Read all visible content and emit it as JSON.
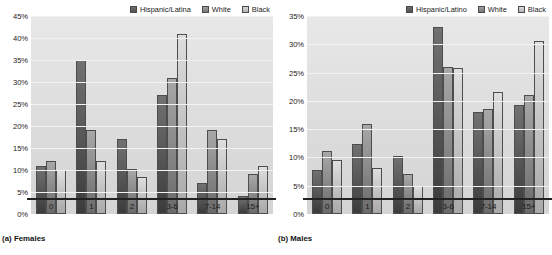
{
  "figure": {
    "panels": [
      {
        "caption": "(a) Females",
        "legend": [
          {
            "label": "Hispanic/Latina",
            "color": "#5a5a5a"
          },
          {
            "label": "White",
            "color": "#8c8c8c"
          },
          {
            "label": "Black",
            "color": "#c6c6c6"
          }
        ],
        "chart_data": {
          "type": "bar",
          "title": "(a) Females",
          "xlabel": "",
          "ylabel": "",
          "ylim": [
            0,
            45
          ],
          "ytick_labels": [
            "0%",
            "5%",
            "10%",
            "15%",
            "20%",
            "25%",
            "30%",
            "35%",
            "40%",
            "45%"
          ],
          "yticks": [
            0,
            5,
            10,
            15,
            20,
            25,
            30,
            35,
            40,
            45
          ],
          "grid": true,
          "legend_position": "top-right",
          "categories": [
            "0",
            "1",
            "2",
            "3-6",
            "7-14",
            "15+"
          ],
          "series": [
            {
              "name": "Hispanic/Latina",
              "values": [
                11,
                35,
                17,
                27,
                7,
                4
              ]
            },
            {
              "name": "White",
              "values": [
                12,
                19,
                10.2,
                31,
                19,
                9
              ]
            },
            {
              "name": "Black",
              "values": [
                10,
                12,
                8.3,
                41,
                17,
                11
              ]
            }
          ]
        }
      },
      {
        "caption": "(b) Males",
        "legend": [
          {
            "label": "Hispanic/Latino",
            "color": "#5a5a5a"
          },
          {
            "label": "White",
            "color": "#8c8c8c"
          },
          {
            "label": "Black",
            "color": "#c6c6c6"
          }
        ],
        "chart_data": {
          "type": "bar",
          "title": "(b) Males",
          "xlabel": "",
          "ylabel": "",
          "ylim": [
            0,
            35
          ],
          "ytick_labels": [
            "0%",
            "5%",
            "10%",
            "15%",
            "20%",
            "25%",
            "30%",
            "35%"
          ],
          "yticks": [
            0,
            5,
            10,
            15,
            20,
            25,
            30,
            35
          ],
          "grid": true,
          "legend_position": "top-right",
          "categories": [
            "0",
            "1",
            "2",
            "3-6",
            "7-14",
            "15+"
          ],
          "series": [
            {
              "name": "Hispanic/Latino",
              "values": [
                7.8,
                12.4,
                10.2,
                33,
                18,
                19.2
              ]
            },
            {
              "name": "White",
              "values": [
                11.2,
                16,
                7,
                26,
                18.5,
                21
              ]
            },
            {
              "name": "Black",
              "values": [
                9.6,
                8.2,
                5,
                25.8,
                21.5,
                30.5
              ]
            }
          ]
        }
      }
    ]
  }
}
